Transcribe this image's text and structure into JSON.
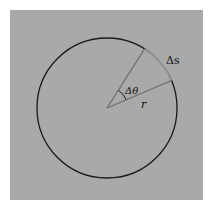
{
  "diagram": {
    "type": "circle-arc-angle",
    "labels": {
      "arc_length": "Δs",
      "angle": "Δθ",
      "radius": "r"
    },
    "colors": {
      "background": "#ffffff",
      "panel": "#a9a9a9",
      "circle": "#1a1a1a",
      "radius_lines": "#707070",
      "highlighted_arc": "#8a8a8a"
    }
  }
}
